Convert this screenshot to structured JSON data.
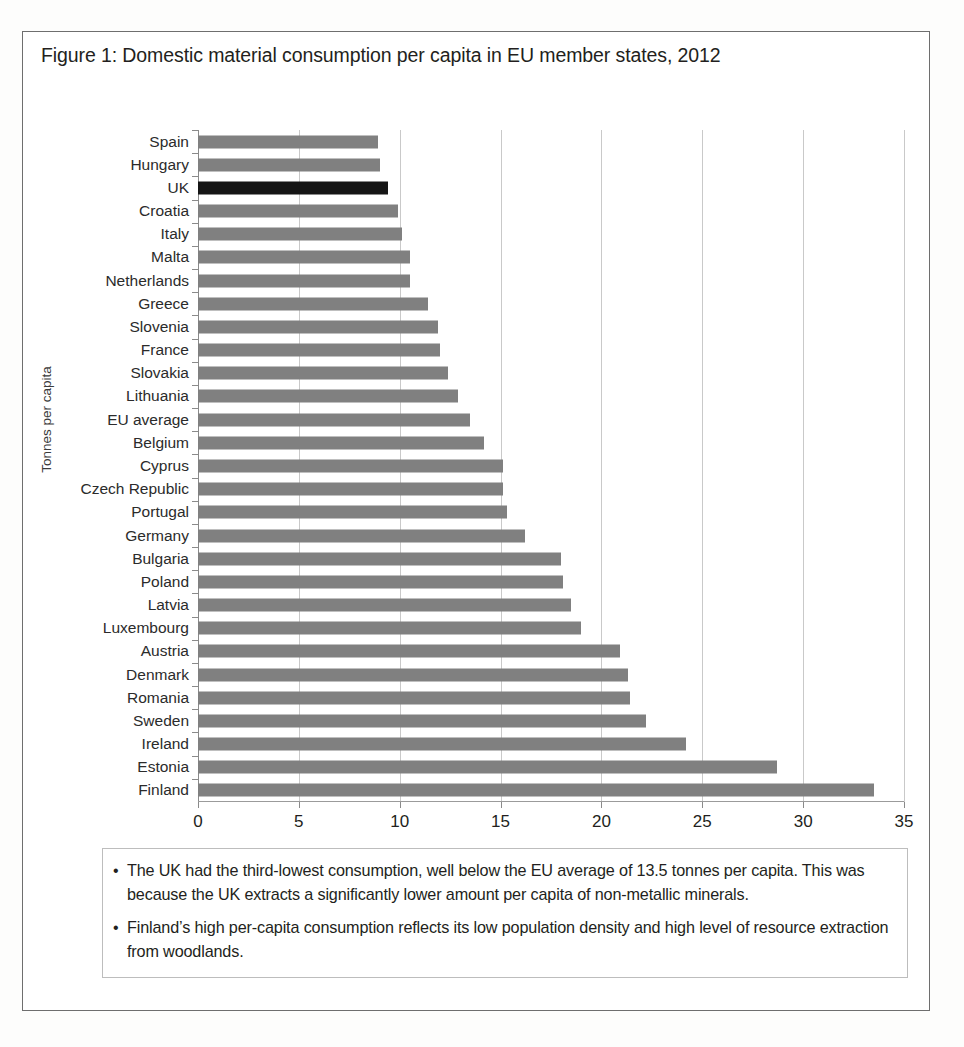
{
  "figure": {
    "title": "Figure 1: Domestic material consumption per capita in EU member states, 2012"
  },
  "colors": {
    "bar": "#808080",
    "highlight_bar": "#151515",
    "gridline": "#c9c9c9",
    "axis": "#8a8a8a",
    "border": "#6e6e6e",
    "text": "#231f20"
  },
  "chart_data": {
    "type": "bar",
    "orientation": "horizontal",
    "title": "Figure 1: Domestic material consumption per capita in EU member states, 2012",
    "xlabel": "",
    "ylabel": "Tonnes per capita",
    "xlim": [
      0,
      35
    ],
    "xticks": [
      0,
      5,
      10,
      15,
      20,
      25,
      30,
      35
    ],
    "xtick_labels": [
      "0",
      "5",
      "10",
      "15",
      "20",
      "25",
      "30",
      "35"
    ],
    "grid": true,
    "legend": false,
    "highlight_category": "UK",
    "units": "tonnes per capita",
    "categories": [
      "Spain",
      "Hungary",
      "UK",
      "Croatia",
      "Italy",
      "Malta",
      "Netherlands",
      "Greece",
      "Slovenia",
      "France",
      "Slovakia",
      "Lithuania",
      "EU average",
      "Belgium",
      "Cyprus",
      "Czech Republic",
      "Portugal",
      "Germany",
      "Bulgaria",
      "Poland",
      "Latvia",
      "Luxembourg",
      "Austria",
      "Denmark",
      "Romania",
      "Sweden",
      "Ireland",
      "Estonia",
      "Finland"
    ],
    "values": [
      8.9,
      9.0,
      9.4,
      9.9,
      10.1,
      10.5,
      10.5,
      11.4,
      11.9,
      12.0,
      12.4,
      12.9,
      13.5,
      14.2,
      15.1,
      15.1,
      15.3,
      16.2,
      18.0,
      18.1,
      18.5,
      19.0,
      20.9,
      21.3,
      21.4,
      22.2,
      24.2,
      28.7,
      33.5
    ]
  },
  "notes": [
    {
      "bullet": "•",
      "text": "The UK had the third-lowest consumption, well below the EU average of 13.5 tonnes per capita. This was because the UK extracts a significantly lower amount per capita of non-metallic minerals."
    },
    {
      "bullet": "•",
      "text": "Finland’s high per-capita consumption reflects its low population density and high level of resource extraction from woodlands."
    }
  ]
}
